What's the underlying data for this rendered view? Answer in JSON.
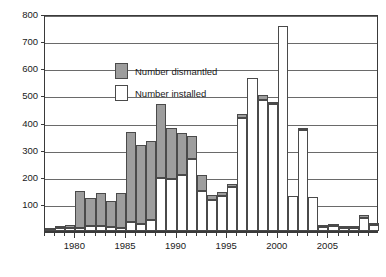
{
  "legend": {
    "position": "inside-top-left",
    "entries": [
      {
        "key": "dismantled",
        "label": "Number dismantled",
        "color": "#9d9d9d"
      },
      {
        "key": "installed",
        "label": "Number installed",
        "color": "#ffffff"
      }
    ]
  },
  "axes": {
    "y_ticks": [
      800,
      700,
      600,
      500,
      400,
      300,
      200,
      100
    ],
    "x_ticks": [
      1980,
      1985,
      1990,
      1995,
      2000,
      2005
    ],
    "ylim": [
      0,
      800
    ],
    "xlim": [
      1976.5,
      2009.5
    ],
    "grid": true
  },
  "chart_data": {
    "type": "bar",
    "title": "",
    "subtitle": "",
    "xlabel": "",
    "ylabel": "",
    "ylim": [
      0,
      800
    ],
    "grid": true,
    "stacked": true,
    "legend_position": "inside-top-left",
    "categories": [
      1977,
      1978,
      1979,
      1980,
      1981,
      1982,
      1983,
      1984,
      1985,
      1986,
      1987,
      1988,
      1989,
      1990,
      1991,
      1992,
      1993,
      1994,
      1995,
      1996,
      1997,
      1998,
      1999,
      2000,
      2001,
      2002,
      2003,
      2004,
      2005,
      2006,
      2007,
      2008,
      2009
    ],
    "series": [
      {
        "name": "Number installed",
        "color": "#ffffff",
        "values": [
          5,
          10,
          12,
          12,
          18,
          18,
          15,
          12,
          32,
          25,
          42,
          195,
          190,
          205,
          265,
          148,
          115,
          128,
          162,
          418,
          565,
          482,
          468,
          755,
          130,
          372,
          125,
          15,
          18,
          12,
          12,
          48,
          22
        ]
      },
      {
        "name": "Number dismantled",
        "color": "#9d9d9d",
        "values": [
          3,
          8,
          12,
          135,
          105,
          122,
          95,
          128,
          332,
          292,
          290,
          272,
          190,
          158,
          85,
          58,
          18,
          15,
          10,
          15,
          0,
          18,
          8,
          0,
          0,
          8,
          0,
          5,
          5,
          3,
          3,
          10,
          8
        ]
      }
    ],
    "totals": [
      8,
      18,
      24,
      147,
      123,
      140,
      110,
      140,
      364,
      317,
      332,
      467,
      380,
      363,
      350,
      206,
      133,
      143,
      172,
      433,
      565,
      500,
      476,
      755,
      130,
      380,
      125,
      20,
      23,
      15,
      15,
      58,
      30
    ]
  }
}
